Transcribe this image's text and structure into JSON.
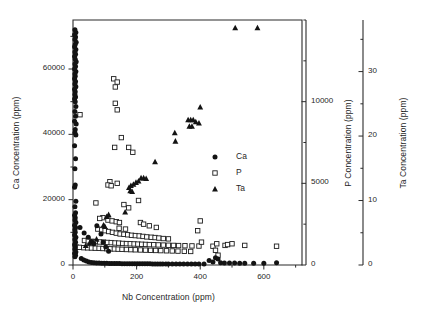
{
  "figure": {
    "background": "#ffffff",
    "ink_color": "#1a1a1a"
  },
  "axes": {
    "x": {
      "label": "Nb Concentration (ppm)",
      "ticks": [
        "0",
        "200",
        "400",
        "600"
      ],
      "tick_values": [
        0,
        200,
        400,
        600
      ],
      "range": [
        0,
        720
      ]
    },
    "y_left": {
      "label": "Ca Concentration (ppm)",
      "ticks": [
        "0",
        "20000",
        "40000",
        "60000"
      ],
      "tick_values": [
        0,
        20000,
        40000,
        60000
      ],
      "range": [
        0,
        75000
      ]
    },
    "y_right_1": {
      "label": "P Concentration (ppm)",
      "ticks": [
        "0",
        "5000",
        "10000"
      ],
      "tick_values": [
        0,
        5000,
        10000
      ],
      "range": [
        0,
        15000
      ]
    },
    "y_right_2": {
      "label": "Ta Concentration (ppm)",
      "ticks": [
        "0",
        "10",
        "20",
        "30"
      ],
      "tick_values": [
        0,
        10,
        20,
        30
      ],
      "range": [
        0,
        38
      ]
    }
  },
  "legend": {
    "entries": [
      {
        "label": "Ca",
        "marker": "filled-circle"
      },
      {
        "label": "P",
        "marker": "open-square"
      },
      {
        "label": "Ta",
        "marker": "filled-triangle"
      }
    ]
  },
  "chart_data": {
    "type": "scatter",
    "title": "",
    "xlabel": "Nb Concentration (ppm)",
    "ylabel": "Ca Concentration (ppm)",
    "xlim": [
      0,
      720
    ],
    "ylim": [
      0,
      75000
    ],
    "grid": false,
    "legend_position": "inside-right",
    "axis_labels_secondary": [
      "P Concentration (ppm)",
      "Ta Concentration (ppm)"
    ],
    "series": [
      {
        "name": "Ca",
        "marker": "filled-circle",
        "color": "#131313",
        "yaxis": "y_left",
        "ylim": [
          0,
          75000
        ],
        "points": [
          [
            6,
            72000
          ],
          [
            9,
            71200
          ],
          [
            5,
            70500
          ],
          [
            8,
            69800
          ],
          [
            6,
            69000
          ],
          [
            10,
            68200
          ],
          [
            7,
            67500
          ],
          [
            5,
            66800
          ],
          [
            9,
            66000
          ],
          [
            6,
            65200
          ],
          [
            8,
            64500
          ],
          [
            5,
            63800
          ],
          [
            7,
            63000
          ],
          [
            10,
            62200
          ],
          [
            6,
            61500
          ],
          [
            8,
            60800
          ],
          [
            5,
            60000
          ],
          [
            9,
            59200
          ],
          [
            6,
            58500
          ],
          [
            7,
            57800
          ],
          [
            5,
            57000
          ],
          [
            8,
            56200
          ],
          [
            6,
            55400
          ],
          [
            9,
            54600
          ],
          [
            5,
            53800
          ],
          [
            7,
            53000
          ],
          [
            6,
            52200
          ],
          [
            8,
            51400
          ],
          [
            5,
            50800
          ],
          [
            7,
            50000
          ],
          [
            9,
            48500
          ],
          [
            6,
            47000
          ],
          [
            8,
            45500
          ],
          [
            5,
            44000
          ],
          [
            10,
            43200
          ],
          [
            7,
            41500
          ],
          [
            6,
            40500
          ],
          [
            9,
            39800
          ],
          [
            5,
            36500
          ],
          [
            8,
            32500
          ],
          [
            6,
            29500
          ],
          [
            7,
            24500
          ],
          [
            5,
            23800
          ],
          [
            9,
            19500
          ],
          [
            6,
            17800
          ],
          [
            8,
            16000
          ],
          [
            5,
            15200
          ],
          [
            7,
            14500
          ],
          [
            6,
            13800
          ],
          [
            9,
            13000
          ],
          [
            5,
            12200
          ],
          [
            8,
            11500
          ],
          [
            6,
            10800
          ],
          [
            7,
            10000
          ],
          [
            5,
            9200
          ],
          [
            9,
            8500
          ],
          [
            6,
            7800
          ],
          [
            8,
            7000
          ],
          [
            5,
            6200
          ],
          [
            7,
            5500
          ],
          [
            6,
            4800
          ],
          [
            9,
            4000
          ],
          [
            5,
            3500
          ],
          [
            8,
            3000
          ],
          [
            6,
            2500
          ],
          [
            22,
            11500
          ],
          [
            35,
            9800
          ],
          [
            48,
            8500
          ],
          [
            58,
            7200
          ],
          [
            66,
            6500
          ],
          [
            75,
            12000
          ],
          [
            88,
            9500
          ],
          [
            95,
            7000
          ],
          [
            103,
            5500
          ],
          [
            112,
            4200
          ],
          [
            26,
            2000
          ],
          [
            34,
            1500
          ],
          [
            42,
            1200
          ],
          [
            50,
            900
          ],
          [
            58,
            800
          ],
          [
            66,
            700
          ],
          [
            74,
            650
          ],
          [
            82,
            600
          ],
          [
            90,
            550
          ],
          [
            98,
            520
          ],
          [
            106,
            500
          ],
          [
            114,
            480
          ],
          [
            122,
            460
          ],
          [
            130,
            450
          ],
          [
            138,
            440
          ],
          [
            146,
            430
          ],
          [
            154,
            420
          ],
          [
            162,
            410
          ],
          [
            170,
            400
          ],
          [
            178,
            390
          ],
          [
            186,
            380
          ],
          [
            194,
            375
          ],
          [
            202,
            370
          ],
          [
            210,
            365
          ],
          [
            218,
            360
          ],
          [
            226,
            355
          ],
          [
            234,
            350
          ],
          [
            242,
            345
          ],
          [
            250,
            340
          ],
          [
            258,
            335
          ],
          [
            266,
            330
          ],
          [
            274,
            325
          ],
          [
            282,
            320
          ],
          [
            292,
            315
          ],
          [
            300,
            310
          ],
          [
            312,
            305
          ],
          [
            324,
            300
          ],
          [
            336,
            295
          ],
          [
            348,
            290
          ],
          [
            360,
            290
          ],
          [
            372,
            285
          ],
          [
            384,
            285
          ],
          [
            396,
            280
          ],
          [
            412,
            280
          ],
          [
            428,
            1400
          ],
          [
            440,
            900
          ],
          [
            448,
            2200
          ],
          [
            456,
            1800
          ],
          [
            464,
            700
          ],
          [
            476,
            600
          ],
          [
            492,
            600
          ],
          [
            508,
            580
          ],
          [
            524,
            560
          ],
          [
            540,
            540
          ],
          [
            568,
            520
          ],
          [
            600,
            500
          ],
          [
            640,
            700
          ]
        ]
      },
      {
        "name": "P",
        "marker": "open-square",
        "color": "#1d1d1d",
        "yaxis": "y_right_1",
        "ylim": [
          0,
          15000
        ],
        "points": [
          [
            128,
            11400
          ],
          [
            139,
            11200
          ],
          [
            133,
            10900
          ],
          [
            133,
            9900
          ],
          [
            139,
            9500
          ],
          [
            22,
            9200
          ],
          [
            152,
            7800
          ],
          [
            131,
            7200
          ],
          [
            175,
            7200
          ],
          [
            188,
            6900
          ],
          [
            116,
            5100
          ],
          [
            110,
            4900
          ],
          [
            120,
            4850
          ],
          [
            139,
            5000
          ],
          [
            72,
            3800
          ],
          [
            160,
            3700
          ],
          [
            206,
            3950
          ],
          [
            175,
            3500
          ],
          [
            94,
            2900
          ],
          [
            84,
            2850
          ],
          [
            110,
            2750
          ],
          [
            123,
            2700
          ],
          [
            136,
            2650
          ],
          [
            146,
            2600
          ],
          [
            212,
            2600
          ],
          [
            222,
            2500
          ],
          [
            240,
            2400
          ],
          [
            262,
            2300
          ],
          [
            145,
            2250
          ],
          [
            165,
            2200
          ],
          [
            78,
            2200
          ],
          [
            90,
            2150
          ],
          [
            101,
            2100
          ],
          [
            112,
            2050
          ],
          [
            124,
            2000
          ],
          [
            136,
            1950
          ],
          [
            148,
            1900
          ],
          [
            160,
            1880
          ],
          [
            172,
            1850
          ],
          [
            184,
            1820
          ],
          [
            196,
            1800
          ],
          [
            208,
            1780
          ],
          [
            220,
            1750
          ],
          [
            232,
            1720
          ],
          [
            246,
            1700
          ],
          [
            258,
            1680
          ],
          [
            270,
            1650
          ],
          [
            284,
            1620
          ],
          [
            300,
            1600
          ],
          [
            36,
            1500
          ],
          [
            48,
            1470
          ],
          [
            60,
            1450
          ],
          [
            72,
            1430
          ],
          [
            84,
            1410
          ],
          [
            96,
            1400
          ],
          [
            108,
            1380
          ],
          [
            120,
            1370
          ],
          [
            132,
            1350
          ],
          [
            144,
            1340
          ],
          [
            156,
            1320
          ],
          [
            168,
            1310
          ],
          [
            180,
            1300
          ],
          [
            192,
            1290
          ],
          [
            204,
            1280
          ],
          [
            216,
            1270
          ],
          [
            228,
            1260
          ],
          [
            240,
            1250
          ],
          [
            254,
            1240
          ],
          [
            268,
            1230
          ],
          [
            284,
            1220
          ],
          [
            300,
            1210
          ],
          [
            316,
            1200
          ],
          [
            332,
            1190
          ],
          [
            352,
            1180
          ],
          [
            374,
            1170
          ],
          [
            396,
            1160
          ],
          [
            10,
            1100
          ],
          [
            20,
            1080
          ],
          [
            34,
            1060
          ],
          [
            46,
            1050
          ],
          [
            58,
            1040
          ],
          [
            70,
            1030
          ],
          [
            82,
            1020
          ],
          [
            94,
            1010
          ],
          [
            106,
            1000
          ],
          [
            118,
            990
          ],
          [
            130,
            980
          ],
          [
            142,
            970
          ],
          [
            154,
            960
          ],
          [
            168,
            950
          ],
          [
            182,
            940
          ],
          [
            196,
            930
          ],
          [
            212,
            920
          ],
          [
            228,
            910
          ],
          [
            244,
            900
          ],
          [
            260,
            890
          ],
          [
            276,
            880
          ],
          [
            294,
            870
          ],
          [
            312,
            860
          ],
          [
            330,
            850
          ],
          [
            350,
            840
          ],
          [
            370,
            830
          ],
          [
            400,
            2700
          ],
          [
            392,
            2100
          ],
          [
            404,
            1400
          ],
          [
            440,
            1150
          ],
          [
            448,
            900
          ],
          [
            452,
            1300
          ],
          [
            456,
            600
          ],
          [
            478,
            1200
          ],
          [
            486,
            1250
          ],
          [
            500,
            1300
          ],
          [
            540,
            1200
          ],
          [
            640,
            1150
          ]
        ]
      },
      {
        "name": "Ta",
        "marker": "filled-triangle",
        "color": "#131313",
        "yaxis": "y_right_2",
        "ylim": [
          0,
          38
        ],
        "points": [
          [
            510,
            36.8
          ],
          [
            580,
            36.8
          ],
          [
            400,
            24.5
          ],
          [
            362,
            22.5
          ],
          [
            370,
            22.5
          ],
          [
            378,
            22.5
          ],
          [
            386,
            22.2
          ],
          [
            396,
            22.0
          ],
          [
            366,
            21.5
          ],
          [
            374,
            21.5
          ],
          [
            320,
            20.5
          ],
          [
            322,
            19.2
          ],
          [
            258,
            16.0
          ],
          [
            214,
            13.5
          ],
          [
            222,
            13.5
          ],
          [
            230,
            13.4
          ],
          [
            206,
            13.0
          ],
          [
            198,
            12.8
          ],
          [
            190,
            12.5
          ],
          [
            182,
            12.3
          ],
          [
            176,
            12.0
          ],
          [
            180,
            11.5
          ],
          [
            186,
            11.4
          ],
          [
            164,
            8.2
          ],
          [
            112,
            7.8
          ],
          [
            106,
            7.5
          ],
          [
            96,
            6.2
          ],
          [
            100,
            6.0
          ],
          [
            74,
            4.0
          ],
          [
            52,
            3.4
          ],
          [
            40,
            3.0
          ]
        ]
      }
    ]
  }
}
